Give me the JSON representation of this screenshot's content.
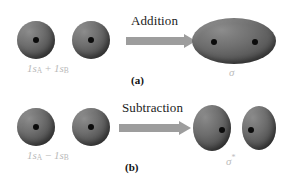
{
  "figure": {
    "background_color": "#ffffff",
    "orbital_color": "#6f6f6f",
    "nucleus_color": "#0b0b0b",
    "arrow_color": "#9d9d9d",
    "label_gray": "#b9b9b9"
  },
  "panel_a": {
    "id": "(a)",
    "operation_label": "Addition",
    "reactant_label_parts": {
      "first_orbital": "1s",
      "first_subscript": "A",
      "operator": "+",
      "second_orbital": "1s",
      "second_subscript": "B"
    },
    "reactant_label_text": "1sA + 1sB",
    "product_label": "σ",
    "product_superscript": "",
    "product_description": "bonding sigma molecular orbital",
    "reactant_orbitals": [
      {
        "name": "1sA",
        "shape": "sphere",
        "cx": 36,
        "cy": 40,
        "r": 19
      },
      {
        "name": "1sB",
        "shape": "sphere",
        "cx": 91,
        "cy": 40,
        "r": 19
      }
    ],
    "product_orbitals": [
      {
        "name": "sigma",
        "shape": "ellipse-horizontal",
        "cx": 234,
        "cy": 41,
        "rx": 42,
        "ry": 23
      }
    ],
    "product_nuclei": [
      {
        "cx": 214,
        "cy": 42
      },
      {
        "cx": 255,
        "cy": 42
      }
    ]
  },
  "panel_b": {
    "id": "(b)",
    "operation_label": "Subtraction",
    "reactant_label_parts": {
      "first_orbital": "1s",
      "first_subscript": "A",
      "operator": "−",
      "second_orbital": "1s",
      "second_subscript": "B"
    },
    "reactant_label_text": "1sA − 1sB",
    "product_label": "σ",
    "product_superscript": "*",
    "product_description": "antibonding sigma-star molecular orbital",
    "reactant_orbitals": [
      {
        "name": "1sA",
        "shape": "sphere",
        "cx": 36,
        "cy": 127,
        "r": 19
      },
      {
        "name": "1sB",
        "shape": "sphere",
        "cx": 91,
        "cy": 127,
        "r": 19
      }
    ],
    "product_orbitals": [
      {
        "name": "sigma-star-left",
        "shape": "ellipse-vertical",
        "cx": 212,
        "cy": 128,
        "rx": 19,
        "ry": 23
      },
      {
        "name": "sigma-star-right",
        "shape": "ellipse-vertical",
        "cx": 259,
        "cy": 128,
        "rx": 17,
        "ry": 22
      }
    ],
    "product_nuclei": [
      {
        "cx": 222,
        "cy": 130
      },
      {
        "cx": 251,
        "cy": 130
      }
    ]
  }
}
